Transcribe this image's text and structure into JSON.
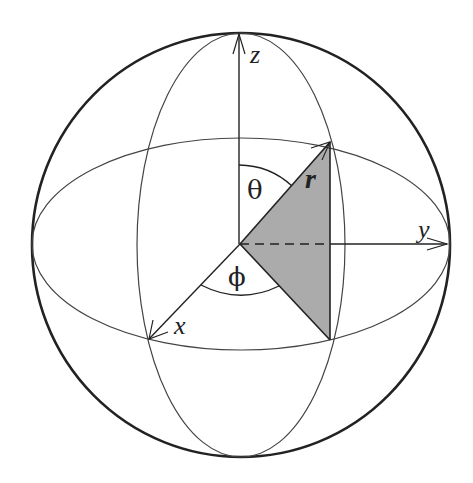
{
  "diagram": {
    "labels": {
      "z_axis": "z",
      "y_axis": "y",
      "x_axis": "x",
      "radius": "r",
      "polar_angle": "θ",
      "azimuth_angle": "ϕ"
    },
    "colors": {
      "stroke": "#222222",
      "thin_stroke": "#444444",
      "shading": "#ababab",
      "background": "#ffffff"
    },
    "geometry": {
      "center": [
        240,
        244
      ],
      "sphere_radius": [
        209,
        212
      ],
      "equator_ellipse_ry": 106,
      "meridian_ellipse_rx": 104,
      "point_top": [
        330,
        142
      ],
      "point_bottom": [
        330,
        340
      ],
      "x_axis_tip": [
        148,
        340
      ]
    }
  }
}
